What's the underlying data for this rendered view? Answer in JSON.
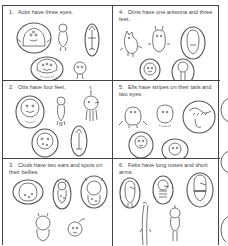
{
  "worksheet": {
    "cells": [
      {
        "number": "1.",
        "text": "Acks have three eyes."
      },
      {
        "number": "4.",
        "text": "Dints have one antenna and three feet."
      },
      {
        "number": "2.",
        "text": "Otts have four feet."
      },
      {
        "number": "5.",
        "text": "Ells have stripes on their tails and two eyes."
      },
      {
        "number": "3.",
        "text": "Cluds have two ears and spots on their bellies."
      },
      {
        "number": "6.",
        "text": "Febs have long noses and short arms."
      }
    ]
  },
  "colors": {
    "line": "#444444",
    "background": "#ffffff",
    "text": "#444444"
  }
}
